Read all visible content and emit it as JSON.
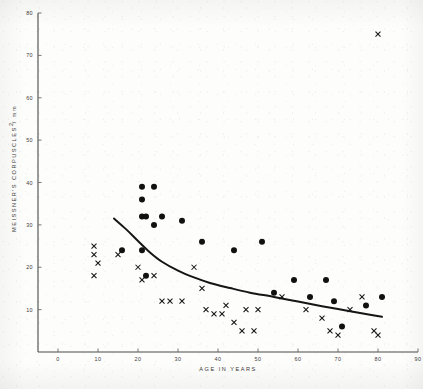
{
  "figure": {
    "caption_y_axis": "MEISSNER'S CORPUSCLES / mm",
    "caption_y_exponent": "2",
    "caption_x_axis": "AGE   IN   YEARS",
    "ink_color": "#111111",
    "axis_color": "#4a4a48",
    "background_color": "#fdfdfc"
  },
  "chart_data": {
    "type": "scatter",
    "title": "",
    "xlabel": "AGE IN YEARS",
    "ylabel": "MEISSNER'S CORPUSCLES / mm2",
    "xlim": [
      -5,
      90
    ],
    "ylim": [
      0,
      80
    ],
    "xticks": [
      0,
      10,
      20,
      30,
      40,
      50,
      60,
      70,
      80,
      90
    ],
    "xticklabels": [
      "0",
      "10",
      "20",
      "30",
      "40",
      "50",
      "60",
      "70",
      "80",
      "90"
    ],
    "yticks": [
      10,
      20,
      30,
      40,
      50,
      60,
      70,
      80
    ],
    "yticklabels": [
      "10",
      "20",
      "30",
      "40",
      "50",
      "60",
      "70",
      "80"
    ],
    "grid": false,
    "legend": "none",
    "series": [
      {
        "name": "filled-circle-subjects",
        "marker": "circle",
        "color": "#111111",
        "points": [
          [
            21,
            39
          ],
          [
            24,
            39
          ],
          [
            21,
            36
          ],
          [
            21,
            32
          ],
          [
            22,
            32
          ],
          [
            26,
            32
          ],
          [
            31,
            31
          ],
          [
            24,
            30
          ],
          [
            16,
            24
          ],
          [
            21,
            24
          ],
          [
            36,
            26
          ],
          [
            44,
            24
          ],
          [
            51,
            26
          ],
          [
            22,
            18
          ],
          [
            54,
            14
          ],
          [
            59,
            17
          ],
          [
            63,
            13
          ],
          [
            69,
            12
          ],
          [
            71,
            6
          ],
          [
            77,
            11
          ],
          [
            81,
            13
          ],
          [
            67,
            17
          ]
        ]
      },
      {
        "name": "cross-subjects",
        "marker": "x",
        "color": "#171717",
        "points": [
          [
            9,
            25
          ],
          [
            9,
            23
          ],
          [
            10,
            21
          ],
          [
            9,
            18
          ],
          [
            15,
            23
          ],
          [
            20,
            20
          ],
          [
            21,
            17
          ],
          [
            24,
            18
          ],
          [
            26,
            12
          ],
          [
            28,
            12
          ],
          [
            31,
            12
          ],
          [
            34,
            20
          ],
          [
            36,
            15
          ],
          [
            37,
            10
          ],
          [
            39,
            9
          ],
          [
            41,
            9
          ],
          [
            42,
            11
          ],
          [
            44,
            7
          ],
          [
            46,
            5
          ],
          [
            49,
            5
          ],
          [
            50,
            10
          ],
          [
            47,
            10
          ],
          [
            56,
            13
          ],
          [
            62,
            10
          ],
          [
            66,
            8
          ],
          [
            68,
            5
          ],
          [
            70,
            4
          ],
          [
            73,
            10
          ],
          [
            76,
            13
          ],
          [
            79,
            5
          ],
          [
            80,
            4
          ],
          [
            80,
            75
          ]
        ]
      }
    ],
    "fit_curve": {
      "name": "fitted-trend-line",
      "color": "#151515",
      "points": [
        [
          14,
          31.5
        ],
        [
          17,
          29.0
        ],
        [
          20,
          26.2
        ],
        [
          23,
          23.5
        ],
        [
          26,
          21.3
        ],
        [
          30,
          19.2
        ],
        [
          34,
          17.6
        ],
        [
          38,
          16.3
        ],
        [
          43,
          15.1
        ],
        [
          48,
          14.0
        ],
        [
          54,
          13.0
        ],
        [
          60,
          11.9
        ],
        [
          66,
          10.8
        ],
        [
          72,
          9.8
        ],
        [
          78,
          8.8
        ],
        [
          81,
          8.3
        ]
      ]
    }
  }
}
